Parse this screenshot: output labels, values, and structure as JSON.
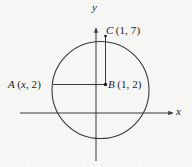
{
  "figure": {
    "background_color": "#f6f6f4",
    "stroke_color": "#3a3a3a",
    "text_color": "#1b1b1b",
    "axes": {
      "x_label": "x",
      "y_label": "y",
      "x_axis_y_px": 113,
      "x_axis_from_px": 20,
      "x_axis_to_px": 173,
      "y_axis_x_px": 96,
      "y_axis_from_px": 160,
      "y_axis_to_px": 28
    },
    "circle": {
      "center_px": [
        100.5,
        90
      ],
      "radius_px": 48.5
    },
    "points": [
      {
        "id": "A",
        "label": "A (x, 2)",
        "name": "A",
        "coords": "(x, 2)",
        "pos_px": [
          53,
          84.5
        ]
      },
      {
        "id": "B",
        "label": "B (1, 2)",
        "name": "B",
        "coords": "(1, 2)",
        "pos_px": [
          105.5,
          84.5
        ]
      },
      {
        "id": "C",
        "label": "C (1, 7)",
        "name": "C",
        "coords": "(1, 7)",
        "pos_px": [
          105.5,
          36
        ]
      }
    ],
    "segments": [
      {
        "id": "AB",
        "from": "A",
        "to": "B",
        "orientation": "horizontal"
      },
      {
        "id": "BC",
        "from": "B",
        "to": "C",
        "orientation": "vertical"
      }
    ]
  }
}
